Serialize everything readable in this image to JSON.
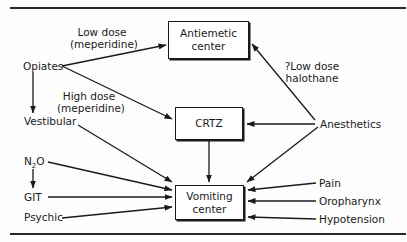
{
  "diagram": {
    "boxes": {
      "antiemetic": "Antiemetic center",
      "antiemetic_l1": "Antiemetic",
      "antiemetic_l2": "center",
      "crtz": "CRTZ",
      "vomiting_l1": "Vomiting",
      "vomiting_l2": "center"
    },
    "nodes": {
      "opiates": "Opiates",
      "vestibular": "Vestibular",
      "n2o_main": "N",
      "n2o_sub": "2",
      "n2o_end": "O",
      "git": "GIT",
      "psychic": "Psychic",
      "anesthetics": "Anesthetics",
      "pain": "Pain",
      "oropharynx": "Oropharynx",
      "hypotension": "Hypotension"
    },
    "edge_labels": {
      "low_dose_l1": "Low dose",
      "low_dose_l2": "(meperidine)",
      "high_dose_l1": "High dose",
      "high_dose_l2": "(meperidine)",
      "halothane_l1": "?Low dose",
      "halothane_l2": "halothane"
    },
    "edges": [
      {
        "from": "Opiates",
        "to": "Antiemetic center",
        "label": "Low dose (meperidine)"
      },
      {
        "from": "Opiates",
        "to": "CRTZ",
        "label": "High dose (meperidine)"
      },
      {
        "from": "Opiates",
        "to": "Vestibular"
      },
      {
        "from": "Vestibular",
        "to": "Vomiting center"
      },
      {
        "from": "N2O",
        "to": "Vomiting center"
      },
      {
        "from": "N2O",
        "to": "GIT"
      },
      {
        "from": "GIT",
        "to": "Vomiting center"
      },
      {
        "from": "Psychic",
        "to": "Vomiting center"
      },
      {
        "from": "CRTZ",
        "to": "Vomiting center"
      },
      {
        "from": "Anesthetics",
        "to": "Antiemetic center",
        "label": "?Low dose halothane"
      },
      {
        "from": "Anesthetics",
        "to": "CRTZ"
      },
      {
        "from": "Anesthetics",
        "to": "Vomiting center"
      },
      {
        "from": "Pain",
        "to": "Vomiting center"
      },
      {
        "from": "Oropharynx",
        "to": "Vomiting center"
      },
      {
        "from": "Hypotension",
        "to": "Vomiting center"
      }
    ]
  }
}
